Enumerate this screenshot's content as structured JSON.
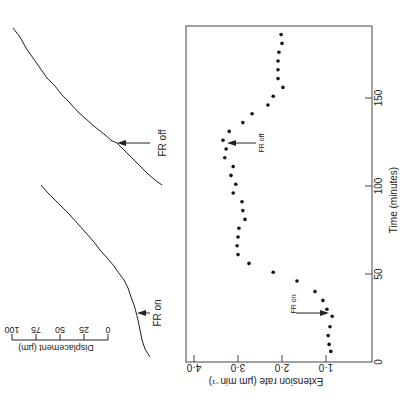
{
  "chart_data": [
    {
      "type": "line",
      "title": "Displacement traces",
      "traces": [
        {
          "name": "lower-trace",
          "annotation": "FR on"
        },
        {
          "name": "upper-trace",
          "annotation": "FR off"
        }
      ],
      "scale_bar": {
        "label": "Displacement (µm)",
        "ticks": [
          "100",
          "75",
          "50",
          "25",
          "0"
        ]
      }
    },
    {
      "type": "scatter",
      "title": "",
      "xlabel": "Time (minutes)",
      "ylabel": "Extension rate (µm min⁻¹)",
      "xlim": [
        0,
        190
      ],
      "ylim": [
        0,
        4.2
      ],
      "x_ticks": [
        "0",
        "50",
        "100",
        "150"
      ],
      "y_ticks": [
        "1·0",
        "2·0",
        "3·0",
        "4·0"
      ],
      "annotations": [
        {
          "text": "FR on",
          "x": 27
        },
        {
          "text": "FR off",
          "x": 123
        }
      ],
      "x": [
        6,
        10,
        15,
        20,
        26,
        30,
        35,
        40,
        46,
        51,
        56,
        61,
        66,
        71,
        76,
        81,
        86,
        91,
        96,
        101,
        106,
        111,
        116,
        121,
        126,
        131,
        136,
        141,
        146,
        151,
        156,
        161,
        166,
        171,
        176,
        181,
        186
      ],
      "values": [
        0.89,
        0.93,
        0.95,
        0.91,
        0.86,
        0.98,
        1.07,
        1.25,
        1.66,
        2.2,
        2.75,
        3.0,
        3.02,
        3.0,
        2.98,
        2.84,
        2.89,
        2.91,
        3.11,
        3.05,
        3.16,
        3.11,
        3.3,
        3.27,
        3.34,
        3.2,
        2.89,
        2.68,
        2.32,
        2.2,
        1.98,
        2.09,
        2.09,
        2.09,
        2.07,
        2.0,
        2.02
      ]
    }
  ],
  "labels": {
    "fr_on": "FR on",
    "fr_off": "FR off",
    "displacement": "Displacement (µm)",
    "time": "Time (minutes)",
    "rate": "Extension rate (µm min⁻¹)",
    "sb": [
      "100",
      "75",
      "50",
      "25",
      "0"
    ],
    "xt": [
      "0",
      "50",
      "100",
      "150"
    ],
    "yt": [
      "1·0",
      "2·0",
      "3·0",
      "4·0"
    ]
  }
}
